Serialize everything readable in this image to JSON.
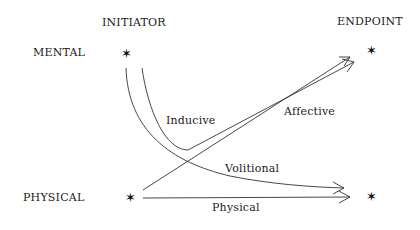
{
  "diagram": {
    "column_headers": {
      "initiator": "INITIATOR",
      "endpoint": "ENDPOINT"
    },
    "row_labels": {
      "mental": "MENTAL",
      "physical": "PHYSICAL"
    },
    "node_icon": "star-of-david-icon",
    "edges": [
      {
        "id": "inducive",
        "label": "Inducive",
        "from": "MENTAL initiator",
        "to": "MENTAL endpoint"
      },
      {
        "id": "affective",
        "label": "Affective",
        "from": "PHYSICAL initiator",
        "to": "MENTAL endpoint"
      },
      {
        "id": "volitional",
        "label": "Volitional",
        "from": "MENTAL initiator",
        "to": "PHYSICAL endpoint"
      },
      {
        "id": "physical",
        "label": "Physical",
        "from": "PHYSICAL initiator",
        "to": "PHYSICAL endpoint"
      }
    ],
    "star_glyph": "✶",
    "line_color": "#333333"
  }
}
